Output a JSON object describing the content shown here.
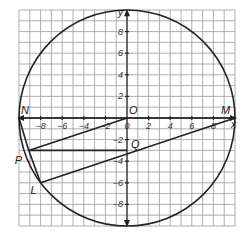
{
  "diagram": {
    "type": "coordinate-geometry",
    "grid": {
      "xmin": -10,
      "xmax": 10,
      "ymin": -10,
      "ymax": 10,
      "step": 1
    },
    "axes": {
      "x_label": "x",
      "y_label": "y"
    },
    "x_ticks": [
      -8,
      -6,
      -4,
      -2,
      0,
      2,
      4,
      6,
      8
    ],
    "y_ticks": [
      8,
      6,
      4,
      2,
      -2,
      -4,
      -6,
      -8
    ],
    "circle": {
      "center": [
        0,
        0
      ],
      "radius": 10
    },
    "points": {
      "N": {
        "label": "N",
        "coords": [
          -10,
          0
        ]
      },
      "M": {
        "label": "M",
        "coords": [
          10,
          0
        ]
      },
      "O": {
        "label": "O",
        "coords": [
          0,
          0
        ]
      },
      "P": {
        "label": "P",
        "coords": [
          -9.1,
          -3
        ]
      },
      "Q": {
        "label": "Q",
        "coords": [
          0,
          -3
        ]
      },
      "L": {
        "label": "L",
        "coords": [
          -8,
          -6
        ]
      }
    },
    "segments": [
      [
        "N",
        "M"
      ],
      [
        "O",
        "P"
      ],
      [
        "P",
        "Q"
      ],
      [
        "L",
        "M"
      ],
      [
        "N",
        "P"
      ],
      [
        "P",
        "L"
      ]
    ],
    "colors": {
      "line": "#222222",
      "grid": "#9a9a9a",
      "background": "#ffffff"
    }
  }
}
